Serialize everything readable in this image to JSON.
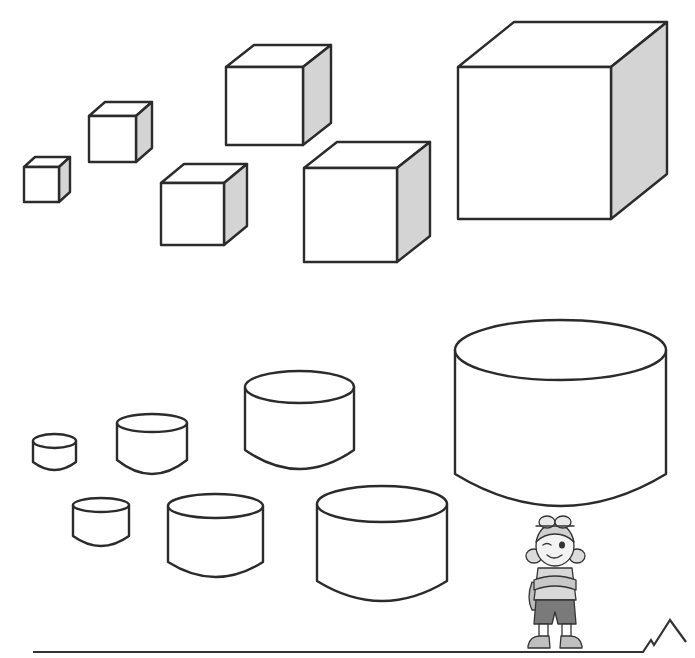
{
  "scene": {
    "description": "Worksheet illustration: cubes and cylinders of varying sizes with a cartoon girl mascot",
    "colors": {
      "outline": "#2b2b2b",
      "shaded_side": "#d4d4d4",
      "background": "#ffffff"
    }
  },
  "cubes": [
    {
      "id": "cube-1",
      "front": [
        24,
        167,
        35,
        35
      ],
      "depth": [
        11,
        -10
      ]
    },
    {
      "id": "cube-2",
      "front": [
        89,
        116,
        47,
        46
      ],
      "depth": [
        16,
        -14
      ]
    },
    {
      "id": "cube-3",
      "front": [
        161,
        183,
        63,
        62
      ],
      "depth": [
        23,
        -19
      ]
    },
    {
      "id": "cube-4",
      "front": [
        226,
        67,
        77,
        78
      ],
      "depth": [
        28,
        -22
      ]
    },
    {
      "id": "cube-5",
      "front": [
        304,
        168,
        93,
        94
      ],
      "depth": [
        33,
        -26
      ]
    },
    {
      "id": "cube-6",
      "front": [
        458,
        67,
        153,
        152
      ],
      "depth": [
        56,
        -45
      ]
    }
  ],
  "cylinders": [
    {
      "id": "cylinder-1",
      "x": 33,
      "w": 43,
      "top_cy": 441,
      "ry": 7,
      "side_bottom": 462,
      "bottom": 470
    },
    {
      "id": "cylinder-2",
      "x": 117,
      "w": 70,
      "top_cy": 423,
      "ry": 9,
      "side_bottom": 460,
      "bottom": 474
    },
    {
      "id": "cylinder-3",
      "x": 73,
      "w": 56,
      "top_cy": 505,
      "ry": 7,
      "side_bottom": 536,
      "bottom": 546
    },
    {
      "id": "cylinder-4",
      "x": 168,
      "w": 95,
      "top_cy": 506,
      "ry": 12,
      "side_bottom": 562,
      "bottom": 577
    },
    {
      "id": "cylinder-5",
      "x": 245,
      "w": 109,
      "top_cy": 387,
      "ry": 16,
      "side_bottom": 450,
      "bottom": 469
    },
    {
      "id": "cylinder-6",
      "x": 317,
      "w": 130,
      "top_cy": 504,
      "ry": 18,
      "side_bottom": 581,
      "bottom": 601
    },
    {
      "id": "cylinder-7",
      "x": 455,
      "w": 211,
      "top_cy": 350,
      "ry": 30,
      "side_bottom": 474,
      "bottom": 506
    }
  ],
  "ground_line": {
    "points": "33,652 643,652 651,640 654,645 670,620 686,642"
  },
  "mascot": {
    "name": "explorer-girl",
    "position": [
      522,
      512
    ]
  }
}
